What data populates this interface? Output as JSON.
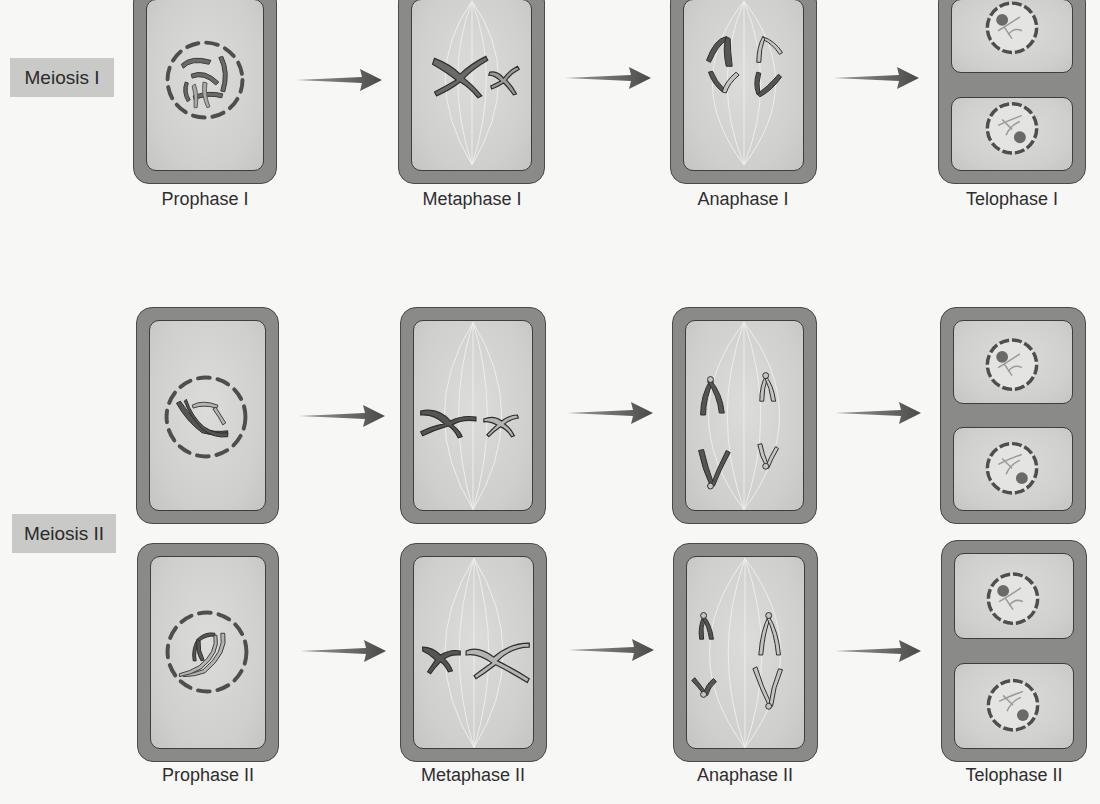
{
  "sections": {
    "meiosis_1": {
      "label": "Meiosis I"
    },
    "meiosis_2": {
      "label": "Meiosis II"
    }
  },
  "stages": {
    "prophase_1": "Prophase I",
    "metaphase_1": "Metaphase I",
    "anaphase_1": "Anaphase I",
    "telophase_1": "Telophase I",
    "prophase_2": "Prophase II",
    "metaphase_2": "Metaphase II",
    "anaphase_2": "Anaphase II",
    "telophase_2": "Telophase II"
  },
  "colors": {
    "background": "#f7f7f6",
    "cell_wall": "#8a8a88",
    "cytoplasm": "#d6d6d4",
    "chromosome_dark": "#5e5e5c",
    "chromosome_light": "#b4b4b2",
    "badge": "#c9c9c7",
    "arrow": "#555553"
  }
}
